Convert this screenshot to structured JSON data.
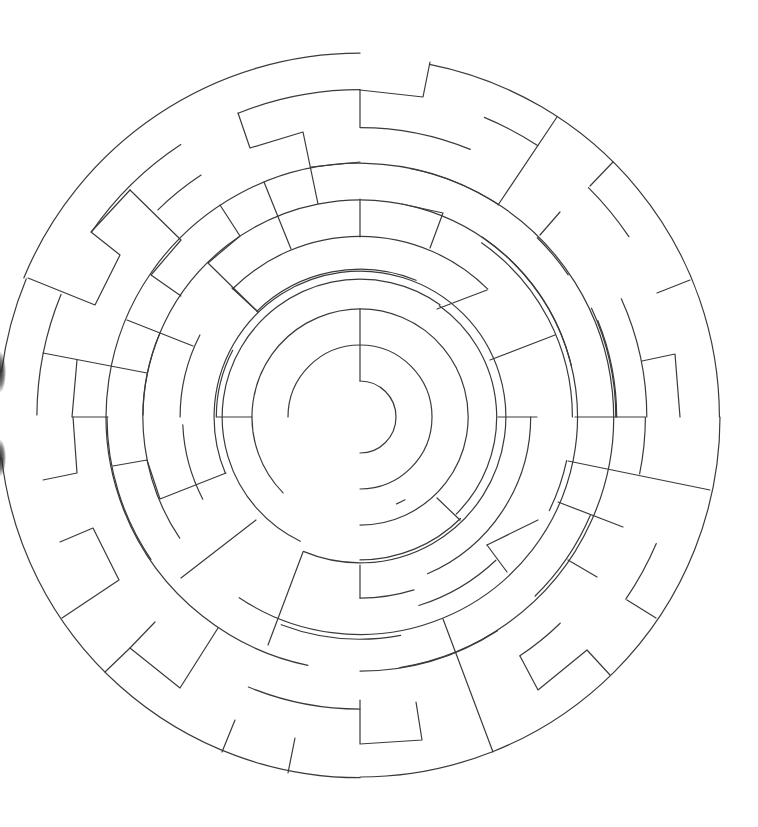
{
  "figure": {
    "kind": "circular-maze",
    "wall_color": "#3a3a3a",
    "background_color": "#ffffff",
    "rings": 10,
    "entrances": [
      "left",
      "top"
    ]
  }
}
